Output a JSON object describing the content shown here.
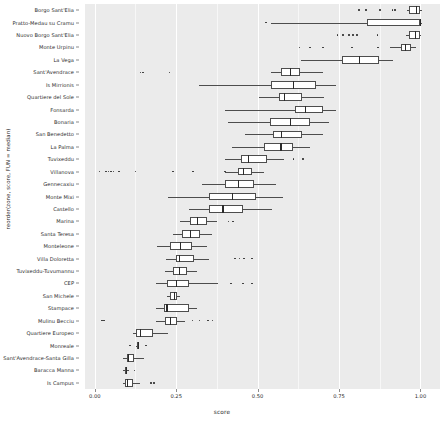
{
  "chart_data": {
    "type": "boxplot",
    "title": "",
    "xlabel": "score",
    "ylabel": "reorder(zone, score, FUN = median)",
    "xlim": [
      -0.03,
      1.06
    ],
    "xticks": [
      0.0,
      0.25,
      0.5,
      0.75,
      1.0
    ],
    "xticklabels": [
      "0.00",
      "0.25",
      "0.50",
      "0.75",
      "1.00"
    ],
    "grid": true,
    "legend": "none",
    "orientation": "horizontal",
    "panel_background": "#ebebeb",
    "box_fill": "#ffffff",
    "line_color": "#4d4d4d",
    "categories": [
      "Borgo Sant'Elia",
      "Pratto-Medau su Cramu",
      "Nuovo Borgo Sant'Elia",
      "Monte Urpinu",
      "La Vega",
      "Sant'Avendrace",
      "Is Mirrionis",
      "Quartiere del Sole",
      "Fonsarda",
      "Bonaria",
      "San Benedetto",
      "La Palma",
      "Tuvixeddu",
      "Villanova",
      "Gennecaxiu",
      "Monte Mixi",
      "Castello",
      "Marina",
      "Santa Teresa",
      "Monteleone",
      "Villa Doloretta",
      "Tuvixeddu-Tuvumannu",
      "CEP",
      "San Michele",
      "Stampace",
      "Mulinu Becciu",
      "Quartiere Europeo",
      "Monreale",
      "Sant'Avendrace-Santa Gilla",
      "Baracca Manna",
      "Is Campus"
    ],
    "boxes": [
      {
        "zone": "Borgo Sant'Elia",
        "min": 0.96,
        "q1": 0.965,
        "median": 0.985,
        "q3": 1.0,
        "max": 1.005,
        "outliers": [
          0.812,
          0.832,
          0.876,
          0.914,
          0.922
        ]
      },
      {
        "zone": "Pratto-Medau su Cramu",
        "min": 0.54,
        "q1": 0.835,
        "median": 0.998,
        "q3": 1.0,
        "max": 1.005,
        "outliers": [
          0.525
        ]
      },
      {
        "zone": "Nuovo Borgo Sant'Elia",
        "min": 0.955,
        "q1": 0.965,
        "median": 0.982,
        "q3": 0.998,
        "max": 1.002,
        "outliers": [
          0.745,
          0.763,
          0.78,
          0.793,
          0.806,
          0.868
        ]
      },
      {
        "zone": "Monte Urpinu",
        "min": 0.905,
        "q1": 0.94,
        "median": 0.952,
        "q3": 0.972,
        "max": 0.985,
        "outliers": [
          0.628,
          0.66,
          0.7,
          0.79,
          0.87
        ]
      },
      {
        "zone": "La Vega",
        "min": 0.632,
        "q1": 0.76,
        "median": 0.812,
        "q3": 0.872,
        "max": 0.916
      },
      {
        "zone": "Sant'Avendrace",
        "min": 0.54,
        "q1": 0.572,
        "median": 0.6,
        "q3": 0.63,
        "max": 0.7,
        "outliers": [
          0.14,
          0.148,
          0.23
        ]
      },
      {
        "zone": "Is Mirrionis",
        "min": 0.32,
        "q1": 0.54,
        "median": 0.608,
        "q3": 0.68,
        "max": 0.74
      },
      {
        "zone": "Quartiere del Sole",
        "min": 0.505,
        "q1": 0.565,
        "median": 0.58,
        "q3": 0.635,
        "max": 0.705
      },
      {
        "zone": "Fonsarda",
        "min": 0.4,
        "q1": 0.615,
        "median": 0.645,
        "q3": 0.7,
        "max": 0.74
      },
      {
        "zone": "Bonaria",
        "min": 0.408,
        "q1": 0.538,
        "median": 0.6,
        "q3": 0.66,
        "max": 0.72
      },
      {
        "zone": "San Benedetto",
        "min": 0.46,
        "q1": 0.548,
        "median": 0.572,
        "q3": 0.635,
        "max": 0.7
      },
      {
        "zone": "La Palma",
        "min": 0.422,
        "q1": 0.52,
        "median": 0.57,
        "q3": 0.61,
        "max": 0.66
      },
      {
        "zone": "Tuvixeddu",
        "min": 0.4,
        "q1": 0.45,
        "median": 0.47,
        "q3": 0.53,
        "max": 0.58,
        "outliers": [
          0.61,
          0.64
        ]
      },
      {
        "zone": "Villanova",
        "min": 0.4,
        "q1": 0.44,
        "median": 0.455,
        "q3": 0.482,
        "max": 0.52,
        "outliers": [
          0.015,
          0.035,
          0.042,
          0.05,
          0.058,
          0.075,
          0.125,
          0.24,
          0.302,
          0.4
        ]
      },
      {
        "zone": "Gennecaxiu",
        "min": 0.33,
        "q1": 0.4,
        "median": 0.44,
        "q3": 0.49,
        "max": 0.555
      },
      {
        "zone": "Monte Mixi",
        "min": 0.225,
        "q1": 0.35,
        "median": 0.42,
        "q3": 0.495,
        "max": 0.578
      },
      {
        "zone": "Castello",
        "min": 0.29,
        "q1": 0.352,
        "median": 0.392,
        "q3": 0.455,
        "max": 0.545
      },
      {
        "zone": "Marina",
        "min": 0.262,
        "q1": 0.292,
        "median": 0.315,
        "q3": 0.345,
        "max": 0.375,
        "outliers": [
          0.41,
          0.425
        ]
      },
      {
        "zone": "Santa Teresa",
        "min": 0.24,
        "q1": 0.268,
        "median": 0.292,
        "q3": 0.322,
        "max": 0.36
      },
      {
        "zone": "Monteleone",
        "min": 0.192,
        "q1": 0.232,
        "median": 0.262,
        "q3": 0.3,
        "max": 0.345
      },
      {
        "zone": "Villa Doloretta",
        "min": 0.218,
        "q1": 0.248,
        "median": 0.258,
        "q3": 0.305,
        "max": 0.35,
        "outliers": [
          0.43,
          0.445,
          0.458,
          0.482
        ]
      },
      {
        "zone": "Tuvixeddu-Tuvumannu",
        "min": 0.215,
        "q1": 0.24,
        "median": 0.258,
        "q3": 0.282,
        "max": 0.315
      },
      {
        "zone": "CEP",
        "min": 0.188,
        "q1": 0.222,
        "median": 0.248,
        "q3": 0.288,
        "max": 0.378,
        "outliers": [
          0.418,
          0.455,
          0.482
        ]
      },
      {
        "zone": "San Michele",
        "min": 0.222,
        "q1": 0.232,
        "median": 0.242,
        "q3": 0.252,
        "max": 0.262
      },
      {
        "zone": "Stampace",
        "min": 0.188,
        "q1": 0.212,
        "median": 0.22,
        "q3": 0.288,
        "max": 0.315
      },
      {
        "zone": "Mulinu Becciu",
        "min": 0.188,
        "q1": 0.215,
        "median": 0.23,
        "q3": 0.252,
        "max": 0.278,
        "outliers": [
          0.022,
          0.028,
          0.3,
          0.322,
          0.348,
          0.362
        ]
      },
      {
        "zone": "Quartiere Europeo",
        "min": 0.118,
        "q1": 0.128,
        "median": 0.138,
        "q3": 0.18,
        "max": 0.225
      },
      {
        "zone": "Monreale",
        "min": 0.128,
        "q1": 0.13,
        "median": 0.132,
        "q3": 0.134,
        "max": 0.136,
        "outliers": [
          0.108,
          0.158
        ]
      },
      {
        "zone": "Sant'Avendrace-Santa Gilla",
        "min": 0.088,
        "q1": 0.098,
        "median": 0.102,
        "q3": 0.12,
        "max": 0.152
      },
      {
        "zone": "Baracca Manna",
        "min": 0.088,
        "q1": 0.092,
        "median": 0.096,
        "q3": 0.1,
        "max": 0.105,
        "outliers": [
          0.122
        ]
      },
      {
        "zone": "Is Campus",
        "min": 0.086,
        "q1": 0.092,
        "median": 0.098,
        "q3": 0.118,
        "max": 0.14,
        "outliers": [
          0.172,
          0.182
        ]
      }
    ]
  }
}
